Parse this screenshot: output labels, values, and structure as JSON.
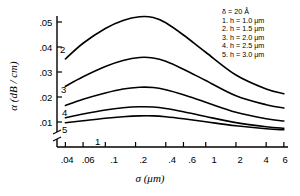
{
  "chart_data": {
    "type": "line",
    "title": "",
    "xlabel": "σ  (μm)",
    "ylabel": "α  (dB / cm)",
    "xscale": "log",
    "yscale": "linear",
    "xlim": [
      0.033,
      6.6
    ],
    "ylim": [
      0.006,
      0.056
    ],
    "grid": false,
    "xticks": [
      0.04,
      0.06,
      0.1,
      0.2,
      0.4,
      0.6,
      1,
      2,
      4,
      6
    ],
    "xticklabels": [
      ".04",
      ".06",
      ".1",
      ".2",
      ".4",
      ".6",
      "1",
      "2",
      "4",
      "6"
    ],
    "yticks": [
      0.01,
      0.02,
      0.03,
      0.04,
      0.05
    ],
    "yticklabels": [
      ".01",
      ".02",
      ".03",
      ".04",
      ".05"
    ],
    "y_axis_break_below": 0.01,
    "legend_position": "upper-right",
    "series": [
      {
        "name": "1",
        "label": "1. h = 1.0 μm",
        "h_um": 1.0,
        "curve_label": "1",
        "x": [
          0.04,
          0.06,
          0.1,
          0.15,
          0.22,
          0.3,
          0.4,
          0.6,
          1.0,
          2.0,
          4.0,
          6.0
        ],
        "y": [
          0.0097,
          0.0105,
          0.0115,
          0.0121,
          0.01245,
          0.01245,
          0.0121,
          0.0113,
          0.0101,
          0.0085,
          0.0073,
          0.0069
        ]
      },
      {
        "name": "2",
        "label": "2. h = 1.5 μm",
        "h_um": 1.5,
        "curve_label": "2",
        "x": [
          0.04,
          0.06,
          0.1,
          0.15,
          0.22,
          0.3,
          0.4,
          0.6,
          1.0,
          2.0,
          4.0,
          6.0
        ],
        "y": [
          0.0352,
          0.0415,
          0.0474,
          0.0506,
          0.0521,
          0.0518,
          0.0497,
          0.0448,
          0.0379,
          0.0288,
          0.0232,
          0.0213
        ]
      },
      {
        "name": "3",
        "label": "3. h = 2.0 μm",
        "h_um": 2.0,
        "curve_label": "3",
        "x": [
          0.04,
          0.06,
          0.1,
          0.15,
          0.22,
          0.3,
          0.4,
          0.6,
          1.0,
          2.0,
          4.0,
          6.0
        ],
        "y": [
          0.0243,
          0.0281,
          0.0322,
          0.0346,
          0.0358,
          0.0356,
          0.0343,
          0.0311,
          0.0266,
          0.0205,
          0.0169,
          0.0156
        ]
      },
      {
        "name": "4",
        "label": "4. h = 2.5 μm",
        "h_um": 2.5,
        "curve_label": "4",
        "x": [
          0.04,
          0.06,
          0.1,
          0.15,
          0.22,
          0.3,
          0.4,
          0.6,
          1.0,
          2.0,
          4.0,
          6.0
        ],
        "y": [
          0.0166,
          0.0191,
          0.0216,
          0.0232,
          0.0239,
          0.0238,
          0.0229,
          0.0209,
          0.0179,
          0.0139,
          0.0113,
          0.0104
        ]
      },
      {
        "name": "5",
        "label": "5. h = 3.0 μm",
        "h_um": 3.0,
        "curve_label": "5",
        "x": [
          0.04,
          0.06,
          0.1,
          0.15,
          0.22,
          0.3,
          0.4,
          0.6,
          1.0,
          2.0,
          4.0,
          6.0
        ],
        "y": [
          0.0117,
          0.0132,
          0.0148,
          0.0157,
          0.0161,
          0.016,
          0.0154,
          0.0141,
          0.0122,
          0.00975,
          0.0081,
          0.0075
        ]
      }
    ],
    "annotations": [
      "δ = 20 Å"
    ]
  },
  "legend": {
    "line0_symbol": "δ",
    "line0_eq": "=",
    "line0_value": "20 A",
    "line0_full": "δ  =  20 Å",
    "rows": [
      "1.  h  =  1.0 μm",
      "2.  h  =  1.5 μm",
      "3.  h  =  2.0 μm",
      "4.  h  =  2.5 μm",
      "5.  h  =  3.0 μm"
    ]
  },
  "axes": {
    "ylabel": "α  (dB / cm)",
    "xlabel": "σ  (μm)",
    "ytick_labels": [
      ".05",
      ".04",
      ".03",
      ".02",
      ".01"
    ],
    "xtick_labels": [
      ".04",
      ".06",
      ".1",
      ".2",
      ".4",
      ".6",
      "1",
      "2",
      "4",
      "6"
    ]
  },
  "curve_labels": [
    "2",
    "3",
    "4",
    "5",
    "1"
  ],
  "colors": {
    "line": "#000000",
    "axis": "#000000",
    "background": "#ffffff"
  }
}
